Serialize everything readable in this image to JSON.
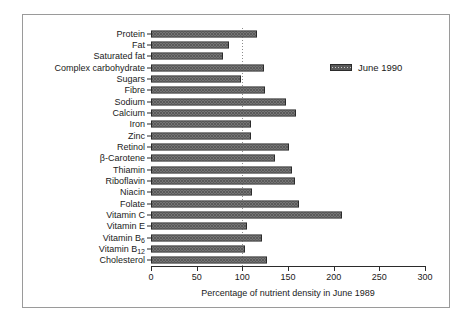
{
  "chart_data": {
    "type": "bar",
    "orientation": "horizontal",
    "title": "",
    "subtitle": "",
    "xlabel": "Percentage of nutrient density in June 1989",
    "ylabel": "",
    "xlim": [
      0,
      300
    ],
    "xticks": [
      0,
      50,
      100,
      150,
      200,
      250,
      300
    ],
    "xticklabels": [
      "0",
      "50",
      "100",
      "150",
      "200",
      "250",
      "300"
    ],
    "grid": false,
    "reference_line": 100,
    "legend": {
      "position": "upper-right",
      "entries": [
        "June 1990"
      ]
    },
    "categories": [
      "Protein",
      "Fat",
      "Saturated fat",
      "Complex carbohydrate",
      "Sugars",
      "Fibre",
      "Sodium",
      "Calcium",
      "Iron",
      "Zinc",
      "Retinol",
      "β-Carotene",
      "Thiamin",
      "Riboflavin",
      "Niacin",
      "Folate",
      "Vitamin C",
      "Vitamin E",
      "Vitamin B6",
      "Vitamin B12",
      "Cholesterol"
    ],
    "series": [
      {
        "name": "June 1990",
        "values": [
          116,
          85,
          79,
          124,
          99,
          125,
          148,
          159,
          109,
          110,
          151,
          136,
          154,
          158,
          111,
          162,
          209,
          105,
          122,
          103,
          127
        ]
      }
    ]
  },
  "axis": {
    "x_title": "Percentage of nutrient density in June 1989",
    "ticks": [
      "0",
      "50",
      "100",
      "150",
      "200",
      "250",
      "300"
    ]
  },
  "legend": {
    "label": "June 1990"
  },
  "labels": {
    "protein": "Protein",
    "fat": "Fat",
    "saturated_fat": "Saturated fat",
    "complex_carbohydrate": "Complex carbohydrate",
    "sugars": "Sugars",
    "fibre": "Fibre",
    "sodium": "Sodium",
    "calcium": "Calcium",
    "iron": "Iron",
    "zinc": "Zinc",
    "retinol": "Retinol",
    "beta_carotene": "β-Carotene",
    "thiamin": "Thiamin",
    "riboflavin": "Riboflavin",
    "niacin": "Niacin",
    "folate": "Folate",
    "vitamin_c": "Vitamin C",
    "vitamin_e": "Vitamin E",
    "vitamin_b6": "Vitamin B",
    "vitamin_b6_sub": "6",
    "vitamin_b12": "Vitamin B",
    "vitamin_b12_sub": "12",
    "cholesterol": "Cholesterol"
  },
  "colors": {
    "bar_fill": "#c9c9c9",
    "bar_hatch": "#5a5a5a",
    "bar_edge": "#2b2b2b",
    "axis": "#2b2b2b",
    "frame": "#9a9a9a",
    "reference_line": "#8c8c8c",
    "background": "#ffffff"
  }
}
